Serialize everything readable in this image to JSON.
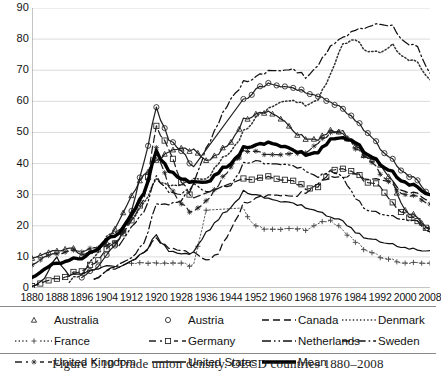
{
  "figure": {
    "caption": "Figure 5.10   Trade union density.  OECD countries 1880–2008"
  },
  "axes": {
    "y": {
      "label": "",
      "min": 0,
      "max": 90,
      "ticks": [
        0,
        10,
        20,
        30,
        40,
        50,
        60,
        70,
        80,
        90
      ],
      "tick_labels": [
        "0",
        "10",
        "20",
        "30",
        "40",
        "50",
        "60",
        "70",
        "80",
        "90"
      ],
      "grid": true
    },
    "x": {
      "label": "",
      "min": 1880,
      "max": 2008,
      "ticks": [
        1880,
        1888,
        1896,
        1904,
        1912,
        1920,
        1928,
        1936,
        1944,
        1952,
        1960,
        1968,
        1976,
        1984,
        1992,
        2000,
        2008
      ],
      "tick_labels": [
        "1880",
        "1888",
        "1896",
        "1904",
        "1912",
        "1920",
        "1928",
        "1936",
        "1944",
        "1952",
        "1960",
        "1968",
        "1976",
        "1984",
        "1992",
        "2000",
        "2008"
      ],
      "grid": false
    }
  },
  "legend": {
    "position": "below-axis",
    "rows": [
      [
        {
          "name": "Australia",
          "marker": "triangle",
          "line": "none",
          "color": "#222222"
        },
        {
          "name": "Austria",
          "marker": "circle",
          "line": "none",
          "color": "#222222"
        },
        {
          "name": "Canada",
          "marker": "none",
          "line": "dashed",
          "color": "#111111"
        },
        {
          "name": "Denmark",
          "marker": "none",
          "line": "dotted",
          "color": "#333333"
        }
      ],
      [
        {
          "name": "France",
          "marker": "plus",
          "line": "dotted",
          "color": "#444444"
        },
        {
          "name": "Germany",
          "marker": "square",
          "line": "dashed",
          "color": "#222222"
        },
        {
          "name": "Netherlands",
          "marker": "none",
          "line": "dashdotdot",
          "color": "#111111"
        },
        {
          "name": "Sweden",
          "marker": "none",
          "line": "dashdot",
          "color": "#111111"
        }
      ],
      [
        {
          "name": "United Kingdom",
          "marker": "star",
          "line": "dashed",
          "color": "#222222"
        },
        {
          "name": "United States",
          "marker": "none",
          "line": "solid",
          "color": "#111111"
        },
        {
          "name": "Mean",
          "marker": "none",
          "line": "thick",
          "color": "#000000"
        }
      ]
    ]
  },
  "chart_data": {
    "type": "line",
    "title": "",
    "subtitle": "",
    "xlabel": "",
    "ylabel": "",
    "xlim": [
      1880,
      2008
    ],
    "ylim": [
      0,
      90
    ],
    "grid": true,
    "legend_position": "below",
    "x": [
      1880,
      1884,
      1888,
      1892,
      1896,
      1900,
      1904,
      1908,
      1912,
      1916,
      1920,
      1924,
      1928,
      1932,
      1936,
      1940,
      1944,
      1948,
      1952,
      1956,
      1960,
      1964,
      1968,
      1972,
      1976,
      1980,
      1984,
      1988,
      1992,
      1996,
      2000,
      2004,
      2008
    ],
    "series": [
      {
        "name": "Australia",
        "marker": "triangle",
        "values": [
          10,
          11,
          12,
          13,
          11,
          12,
          14,
          22,
          30,
          36,
          41,
          44,
          45,
          44,
          41,
          43,
          47,
          54,
          56,
          57,
          55,
          50,
          48,
          48,
          51,
          49,
          46,
          42,
          40,
          34,
          25,
          22,
          19
        ]
      },
      {
        "name": "Austria",
        "marker": "circle",
        "values": [
          null,
          null,
          null,
          null,
          4,
          6,
          10,
          16,
          25,
          40,
          58,
          48,
          44,
          39,
          null,
          null,
          null,
          60,
          64,
          66,
          65,
          64,
          63,
          62,
          60,
          57,
          54,
          50,
          45,
          41,
          37,
          34,
          30
        ]
      },
      {
        "name": "Canada",
        "line": "dashed",
        "values": [
          null,
          null,
          null,
          null,
          null,
          3,
          5,
          7,
          9,
          11,
          16,
          13,
          12,
          11,
          9,
          11,
          19,
          27,
          29,
          30,
          30,
          29,
          31,
          34,
          36,
          35,
          37,
          35,
          35,
          34,
          31,
          30,
          28
        ]
      },
      {
        "name": "Denmark",
        "line": "dotted",
        "values": [
          null,
          null,
          null,
          2,
          5,
          10,
          16,
          19,
          22,
          27,
          35,
          33,
          33,
          35,
          35,
          40,
          44,
          50,
          55,
          58,
          60,
          60,
          59,
          61,
          69,
          78,
          80,
          76,
          76,
          78,
          74,
          72,
          67
        ]
      },
      {
        "name": "France",
        "marker": "plus",
        "line": "dotted",
        "values": [
          null,
          null,
          null,
          null,
          null,
          null,
          null,
          null,
          8,
          8,
          8,
          8,
          8,
          7,
          25,
          null,
          null,
          25,
          20,
          19,
          19,
          19,
          19,
          21,
          22,
          18,
          15,
          12,
          10,
          9,
          8,
          8,
          8
        ]
      },
      {
        "name": "Germany",
        "marker": "square",
        "line": "dashed",
        "values": [
          1,
          2,
          3,
          4,
          6,
          8,
          12,
          16,
          22,
          28,
          52,
          45,
          34,
          29,
          null,
          null,
          null,
          35,
          35,
          36,
          35,
          34,
          32,
          33,
          38,
          38,
          37,
          34,
          33,
          27,
          24,
          21,
          19
        ]
      },
      {
        "name": "Netherlands",
        "line": "dashdotdot",
        "values": [
          null,
          null,
          null,
          null,
          null,
          null,
          null,
          14,
          20,
          24,
          36,
          31,
          30,
          33,
          31,
          32,
          33,
          40,
          41,
          40,
          40,
          39,
          38,
          36,
          38,
          35,
          29,
          25,
          24,
          23,
          22,
          21,
          18
        ]
      },
      {
        "name": "Sweden",
        "line": "dashdot",
        "values": [
          null,
          null,
          null,
          null,
          null,
          3,
          5,
          8,
          10,
          14,
          27,
          27,
          28,
          33,
          45,
          53,
          61,
          66,
          68,
          70,
          70,
          70,
          68,
          72,
          78,
          80,
          83,
          84,
          85,
          84,
          79,
          77,
          69
        ]
      },
      {
        "name": "United Kingdom",
        "marker": "star",
        "line": "dashed",
        "values": [
          8,
          10,
          11,
          12,
          12,
          13,
          13,
          16,
          23,
          30,
          45,
          33,
          27,
          24,
          28,
          33,
          39,
          44,
          44,
          43,
          43,
          43,
          44,
          47,
          50,
          50,
          45,
          42,
          37,
          33,
          30,
          29,
          27
        ]
      },
      {
        "name": "United States",
        "line": "solid",
        "values": [
          1,
          3,
          10,
          4,
          5,
          6,
          7,
          7,
          9,
          11,
          17,
          12,
          11,
          11,
          18,
          22,
          26,
          31,
          30,
          29,
          28,
          27,
          26,
          25,
          23,
          21,
          18,
          16,
          15,
          14,
          13,
          12,
          12
        ]
      },
      {
        "name": "Mean",
        "line": "thick",
        "values": [
          4,
          6,
          8,
          9,
          10,
          12,
          15,
          18,
          24,
          30,
          44,
          38,
          35,
          34,
          34,
          37,
          40,
          45,
          46,
          47,
          46,
          44,
          43,
          44,
          48,
          48,
          47,
          43,
          40,
          37,
          34,
          32,
          30
        ]
      }
    ]
  }
}
